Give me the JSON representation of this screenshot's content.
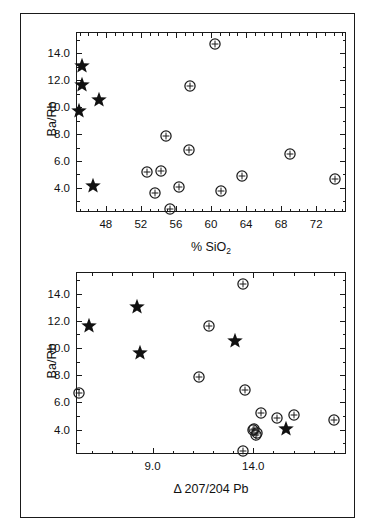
{
  "figure": {
    "background_color": "#ffffff",
    "ink_color": "#1a1a1a",
    "marker_circle_name": "circle-crosshair-marker",
    "marker_star_name": "filled-star-marker"
  },
  "chart_data": [
    {
      "id": "panel-top",
      "type": "scatter",
      "title": "",
      "xlabel": "% SiO2",
      "xlabel_html": "% SiO<sub>2</sub>",
      "ylabel": "Ba/Rb",
      "xlim": [
        44.6,
        75.4
      ],
      "ylim": [
        2.2,
        15.6
      ],
      "xticks_major": [
        48,
        52,
        56,
        60,
        64,
        68,
        72
      ],
      "xticklabels": [
        "48",
        "52",
        "56",
        "60",
        "64",
        "68",
        "72"
      ],
      "xticks_minor": [
        45,
        46,
        47,
        49,
        50,
        51,
        53,
        54,
        55,
        57,
        58,
        59,
        61,
        62,
        63,
        65,
        66,
        67,
        69,
        70,
        71,
        73,
        74,
        75
      ],
      "yticks_major": [
        4.0,
        6.0,
        8.0,
        10.0,
        12.0,
        14.0
      ],
      "yticklabels": [
        "4.0",
        "6.0",
        "8.0",
        "10.0",
        "12.0",
        "14.0"
      ],
      "yticks_minor": [
        3.0,
        5.0,
        7.0,
        9.0,
        11.0,
        13.0,
        15.0
      ],
      "grid": false,
      "legend": false,
      "series": [
        {
          "name": "circle-samples",
          "marker": "circle-crosshair",
          "points": [
            {
              "x": 60.5,
              "y": 14.7
            },
            {
              "x": 57.6,
              "y": 11.6
            },
            {
              "x": 54.9,
              "y": 7.85
            },
            {
              "x": 57.5,
              "y": 6.85
            },
            {
              "x": 69.0,
              "y": 6.5
            },
            {
              "x": 52.7,
              "y": 5.15
            },
            {
              "x": 54.3,
              "y": 5.25
            },
            {
              "x": 63.5,
              "y": 4.85
            },
            {
              "x": 74.2,
              "y": 4.65
            },
            {
              "x": 56.4,
              "y": 4.05
            },
            {
              "x": 61.1,
              "y": 3.75
            },
            {
              "x": 53.6,
              "y": 3.6
            },
            {
              "x": 55.3,
              "y": 2.45
            }
          ]
        },
        {
          "name": "star-samples",
          "marker": "star",
          "points": [
            {
              "x": 45.3,
              "y": 13.1
            },
            {
              "x": 45.3,
              "y": 11.65
            },
            {
              "x": 47.2,
              "y": 10.55
            },
            {
              "x": 44.9,
              "y": 9.7
            },
            {
              "x": 46.5,
              "y": 4.1
            }
          ]
        }
      ]
    },
    {
      "id": "panel-bottom",
      "type": "scatter",
      "title": "",
      "xlabel": "Δ 207/204 Pb",
      "xlabel_html": "Δ 207/204 Pb",
      "ylabel": "Ba/Rb",
      "xlim": [
        5.2,
        18.6
      ],
      "ylim": [
        2.2,
        15.6
      ],
      "xticks_major": [
        9.0,
        14.0
      ],
      "xticklabels": [
        "9.0",
        "14.0"
      ],
      "xticks_minor": [
        6.0,
        7.0,
        8.0,
        10.0,
        11.0,
        12.0,
        13.0,
        15.0,
        16.0,
        17.0,
        18.0
      ],
      "yticks_major": [
        4.0,
        6.0,
        8.0,
        10.0,
        12.0,
        14.0
      ],
      "yticklabels": [
        "4.0",
        "6.0",
        "8.0",
        "10.0",
        "12.0",
        "14.0"
      ],
      "yticks_minor": [
        3.0,
        5.0,
        7.0,
        9.0,
        11.0,
        13.0,
        15.0
      ],
      "grid": false,
      "legend": false,
      "series": [
        {
          "name": "circle-samples",
          "marker": "circle-crosshair",
          "points": [
            {
              "x": 13.5,
              "y": 14.7
            },
            {
              "x": 11.8,
              "y": 11.6
            },
            {
              "x": 11.3,
              "y": 7.85
            },
            {
              "x": 5.35,
              "y": 6.7
            },
            {
              "x": 13.6,
              "y": 6.9
            },
            {
              "x": 14.4,
              "y": 5.25
            },
            {
              "x": 16.0,
              "y": 5.1
            },
            {
              "x": 15.2,
              "y": 4.85
            },
            {
              "x": 18.0,
              "y": 4.7
            },
            {
              "x": 14.05,
              "y": 4.05
            },
            {
              "x": 14.0,
              "y": 3.95
            },
            {
              "x": 14.2,
              "y": 3.75
            },
            {
              "x": 14.15,
              "y": 3.6
            },
            {
              "x": 13.5,
              "y": 2.45
            }
          ]
        },
        {
          "name": "star-samples",
          "marker": "star",
          "points": [
            {
              "x": 8.25,
              "y": 13.05
            },
            {
              "x": 5.85,
              "y": 11.65
            },
            {
              "x": 13.1,
              "y": 10.5
            },
            {
              "x": 8.4,
              "y": 9.6
            },
            {
              "x": 15.6,
              "y": 4.05
            }
          ]
        }
      ]
    }
  ],
  "labels": {
    "panel_top_ylabel": "Ba/Rb",
    "panel_bottom_ylabel": "Ba/Rb",
    "panel_top_xlabel_prefix": "% SiO",
    "panel_top_xlabel_sub": "2",
    "panel_bottom_xlabel": "Δ 207/204 Pb"
  }
}
